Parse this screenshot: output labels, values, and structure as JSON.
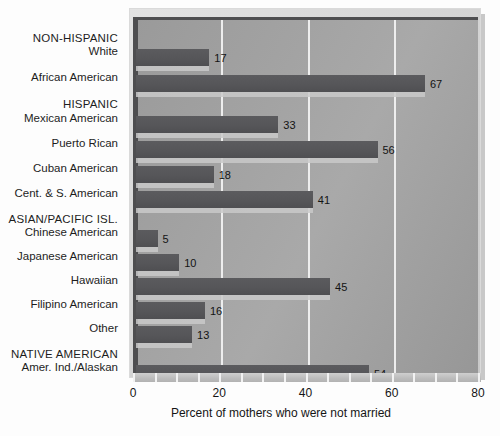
{
  "chart_data": {
    "type": "bar",
    "orientation": "horizontal",
    "title": "",
    "xlabel": "Percent of mothers who were not married",
    "ylabel": "",
    "xlim": [
      0,
      80
    ],
    "xticks": [
      0,
      20,
      40,
      60,
      80
    ],
    "xtick_labels": [
      "0",
      "20",
      "40",
      "60",
      "80"
    ],
    "grid": true,
    "grid_axis": "x",
    "legend": false,
    "value_labels": true,
    "categories": [
      "White",
      "African American",
      "Mexican American",
      "Puerto Rican",
      "Cuban American",
      "Cent. & S. American",
      "Chinese American",
      "Japanese American",
      "Hawaiian",
      "Filipino American",
      "Other",
      "Amer. Ind./Alaskan"
    ],
    "values": [
      17,
      67,
      33,
      56,
      18,
      41,
      5,
      10,
      45,
      16,
      13,
      54
    ],
    "groups": [
      {
        "header": "NON-HISPANIC",
        "categories": [
          "White",
          "African American"
        ]
      },
      {
        "header": "HISPANIC",
        "categories": [
          "Mexican American",
          "Puerto Rican",
          "Cuban American",
          "Cent. & S. American"
        ]
      },
      {
        "header": "ASIAN/PACIFIC ISL.",
        "categories": [
          "Chinese American",
          "Japanese American",
          "Hawaiian",
          "Filipino American",
          "Other"
        ]
      },
      {
        "header": "NATIVE AMERICAN",
        "categories": [
          "Amer. Ind./Alaskan"
        ]
      }
    ],
    "colors": {
      "bar": "#56565a",
      "bar_shadow": "#c9c9c9",
      "plot_background": "#a2a2a2",
      "gridline": "#f4f4f4",
      "axis": "#4e4e50",
      "frame": "#d8d8d8",
      "page_background": "#fdfdfd",
      "text": "#1b1b1b"
    }
  },
  "rows": [
    {
      "kind": "group",
      "label": "NON-HISPANIC",
      "value": null,
      "y": 41,
      "barTop": null,
      "barH": null
    },
    {
      "kind": "bar",
      "label": "White",
      "value": 17,
      "y": 54,
      "barTop": 46,
      "barH": 17
    },
    {
      "kind": "bar",
      "label": "African American",
      "value": 67,
      "y": 80,
      "barTop": 72,
      "barH": 17
    },
    {
      "kind": "group",
      "label": "HISPANIC",
      "value": null,
      "y": 107,
      "barTop": null,
      "barH": null
    },
    {
      "kind": "bar",
      "label": "Mexican American",
      "value": 33,
      "y": 121,
      "barTop": 113,
      "barH": 17
    },
    {
      "kind": "bar",
      "label": "Puerto Rican",
      "value": 56,
      "y": 146,
      "barTop": 138,
      "barH": 17
    },
    {
      "kind": "bar",
      "label": "Cuban American",
      "value": 18,
      "y": 171,
      "barTop": 163,
      "barH": 17
    },
    {
      "kind": "bar",
      "label": "Cent. & S. American",
      "value": 41,
      "y": 196,
      "barTop": 188,
      "barH": 17
    },
    {
      "kind": "group",
      "label": "ASIAN/PACIFIC ISL.",
      "value": null,
      "y": 222,
      "barTop": null,
      "barH": null
    },
    {
      "kind": "bar",
      "label": "Chinese American",
      "value": 5,
      "y": 235,
      "barTop": 227,
      "barH": 17
    },
    {
      "kind": "bar",
      "label": "Japanese American",
      "value": 10,
      "y": 259,
      "barTop": 251,
      "barH": 17
    },
    {
      "kind": "bar",
      "label": "Hawaiian",
      "value": 45,
      "y": 283,
      "barTop": 275,
      "barH": 17
    },
    {
      "kind": "bar",
      "label": "Filipino American",
      "value": 16,
      "y": 307,
      "barTop": 299,
      "barH": 17
    },
    {
      "kind": "bar",
      "label": "Other",
      "value": 13,
      "y": 331,
      "barTop": 323,
      "barH": 17
    },
    {
      "kind": "group",
      "label": "NATIVE AMERICAN",
      "value": null,
      "y": 357,
      "barTop": null,
      "barH": null
    },
    {
      "kind": "bar",
      "label": "Amer. Ind./Alaskan",
      "value": 54,
      "y": 370,
      "barTop": 362,
      "barH": 17
    }
  ],
  "axis": {
    "title": "Percent of mothers who were not married",
    "ticks": [
      "0",
      "20",
      "40",
      "60",
      "80"
    ]
  }
}
